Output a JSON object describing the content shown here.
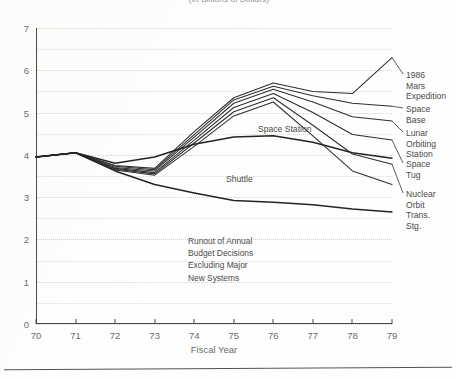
{
  "title": "(In Billions of Dollars)",
  "chart_data": {
    "type": "line",
    "title": "(In Billions of Dollars)",
    "xlabel": "Fiscal Year",
    "ylabel": "",
    "xlim": [
      70,
      79
    ],
    "ylim": [
      0,
      7
    ],
    "x_ticks": [
      "70",
      "71",
      "72",
      "73",
      "74",
      "75",
      "76",
      "77",
      "78",
      "79"
    ],
    "y_ticks": [
      "0",
      "1",
      "2",
      "3",
      "4",
      "5",
      "6",
      "7"
    ],
    "grid": "dotted horizontal every 0.5",
    "legend": "inline end-of-line labels",
    "x": [
      70,
      71,
      72,
      73,
      74,
      75,
      76,
      77,
      78,
      79
    ],
    "series": [
      {
        "name": "1986 Mars Expedition",
        "label": "1986 Mars\nExpedition",
        "values": [
          3.95,
          4.05,
          3.75,
          3.68,
          4.55,
          5.35,
          5.7,
          5.5,
          5.45,
          6.3
        ]
      },
      {
        "name": "Space Base",
        "label": "Space Base",
        "values": [
          3.95,
          4.05,
          3.73,
          3.65,
          4.48,
          5.3,
          5.62,
          5.4,
          5.22,
          5.15
        ]
      },
      {
        "name": "Lunar Orbiting Station",
        "label": "Lunar Orbiting\nStation",
        "values": [
          3.95,
          4.05,
          3.7,
          3.62,
          4.42,
          5.22,
          5.55,
          5.25,
          4.9,
          4.8
        ]
      },
      {
        "name": "Space Tug",
        "label": "Space Tug",
        "values": [
          3.95,
          4.05,
          3.68,
          3.58,
          4.35,
          5.12,
          5.45,
          5.0,
          4.48,
          4.35
        ]
      },
      {
        "name": "Nuclear Orbit Trans. Stg.",
        "label": "Nuclear Orbit\nTrans. Stg.",
        "values": [
          3.95,
          4.05,
          3.66,
          3.55,
          4.28,
          5.02,
          5.35,
          4.7,
          4.02,
          3.78
        ]
      },
      {
        "name": "Space Station",
        "label": "Space Station",
        "values": [
          3.95,
          4.05,
          3.64,
          3.52,
          4.2,
          4.92,
          5.25,
          4.45,
          3.62,
          3.3
        ]
      },
      {
        "name": "Shuttle",
        "label": "Shuttle",
        "values": [
          3.95,
          4.05,
          3.8,
          3.95,
          4.25,
          4.42,
          4.45,
          4.3,
          4.05,
          3.92
        ]
      },
      {
        "name": "Runout baseline",
        "label": "",
        "values": [
          3.95,
          4.05,
          3.62,
          3.3,
          3.1,
          2.92,
          2.88,
          2.82,
          2.72,
          2.65
        ]
      }
    ],
    "annotation": "Runout of Annual\nBudget Decisions\nExcluding Major\nNew Systems"
  },
  "note": {
    "text": "Runout of Annual\nBudget Decisions\nExcluding Major\nNew Systems"
  },
  "axis": {
    "x_title": "Fiscal Year"
  },
  "colors": {
    "line": "#2e2e2e",
    "grid": "#dadad6",
    "axis": "#4a4a4a",
    "text": "#4a4a4a"
  }
}
